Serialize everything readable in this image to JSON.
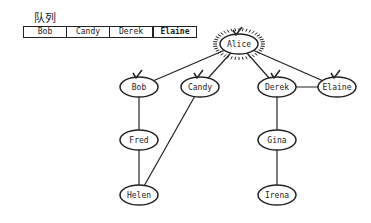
{
  "queue": {
    "label": "队列",
    "items": [
      "Bob",
      "Candy",
      "Derek",
      "Elaine"
    ]
  },
  "graph": {
    "nodes": [
      {
        "id": "alice",
        "label": "Alice",
        "x": 239,
        "y": 44,
        "state": "current"
      },
      {
        "id": "bob",
        "label": "Bob",
        "x": 139,
        "y": 87,
        "state": "visited"
      },
      {
        "id": "candy",
        "label": "Candy",
        "x": 200,
        "y": 87,
        "state": "visited"
      },
      {
        "id": "derek",
        "label": "Derek",
        "x": 277,
        "y": 87,
        "state": "visited"
      },
      {
        "id": "elaine",
        "label": "Elaine",
        "x": 337,
        "y": 87,
        "state": "visited"
      },
      {
        "id": "fred",
        "label": "Fred",
        "x": 139,
        "y": 140,
        "state": "unvisited"
      },
      {
        "id": "gina",
        "label": "Gina",
        "x": 277,
        "y": 140,
        "state": "unvisited"
      },
      {
        "id": "helen",
        "label": "Helen",
        "x": 139,
        "y": 195,
        "state": "unvisited"
      },
      {
        "id": "irena",
        "label": "Irena",
        "x": 277,
        "y": 195,
        "state": "unvisited"
      }
    ],
    "edges": [
      [
        "alice",
        "bob"
      ],
      [
        "alice",
        "candy"
      ],
      [
        "alice",
        "derek"
      ],
      [
        "alice",
        "elaine"
      ],
      [
        "derek",
        "elaine"
      ],
      [
        "bob",
        "fred"
      ],
      [
        "fred",
        "helen"
      ],
      [
        "candy",
        "helen"
      ],
      [
        "derek",
        "gina"
      ],
      [
        "gina",
        "irena"
      ]
    ]
  }
}
